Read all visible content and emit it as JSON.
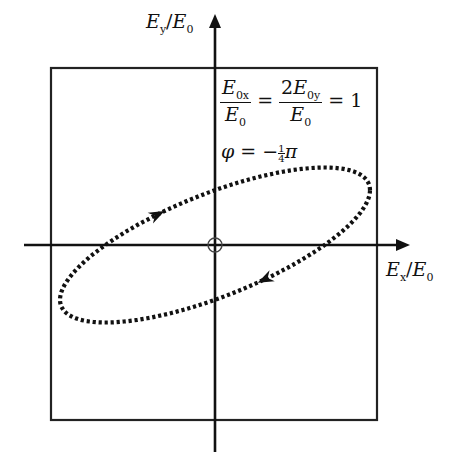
{
  "diagram": {
    "y_axis_label": {
      "main": "E",
      "sub": "y",
      "sep": "/",
      "main2": "E",
      "sub2": "0"
    },
    "x_axis_label": {
      "main": "E",
      "sub": "x",
      "sep": "/",
      "main2": "E",
      "sub2": "0"
    },
    "equation": {
      "frac1_num_main": "E",
      "frac1_num_sub": "0x",
      "frac1_den_main": "E",
      "frac1_den_sub": "0",
      "eq1": "=",
      "frac2_num_coef": "2",
      "frac2_num_main": "E",
      "frac2_num_sub": "0y",
      "frac2_den_main": "E",
      "frac2_den_sub": "0",
      "eq2": "= 1"
    },
    "phase": {
      "symbol": "φ",
      "eq": "= −",
      "frac_num": "1",
      "frac_den": "4",
      "pi": "π"
    },
    "parameters": {
      "E0x_over_E0": 1,
      "E0y_over_E0": 0.5,
      "phi_over_pi": -0.25
    },
    "colors": {
      "stroke": "#111111",
      "background": "#ffffff"
    },
    "geometry": {
      "origin": [
        215,
        245
      ],
      "scale_px_per_unit": 155,
      "box": {
        "x": 51,
        "y": 68,
        "w": 326,
        "h": 352
      },
      "x_axis": {
        "from": 24,
        "to": 410
      },
      "y_axis": {
        "from": 14,
        "to": 452
      }
    }
  }
}
